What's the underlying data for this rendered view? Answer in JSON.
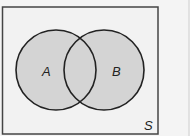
{
  "diagram": {
    "type": "venn",
    "universe_label": "S",
    "sets": [
      {
        "label": "A",
        "shaded": true
      },
      {
        "label": "B",
        "shaded": true
      }
    ],
    "shaded_region": "A ∪ B",
    "colors": {
      "fill": "#d4d4d4",
      "stroke": "#222222",
      "background": "#f4f4f4"
    }
  }
}
